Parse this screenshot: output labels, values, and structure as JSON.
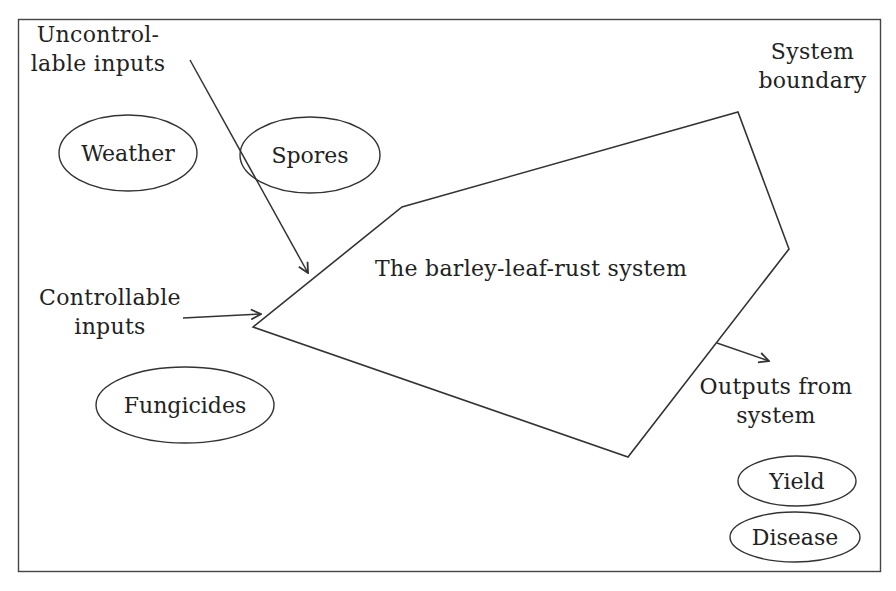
{
  "diagram": {
    "title": "The barley-leaf-rust system",
    "labels": {
      "uncontrollable_line1": "Uncontrol-",
      "uncontrollable_line2": "lable inputs",
      "controllable_line1": "Controllable",
      "controllable_line2": "inputs",
      "boundary_line1": "System",
      "boundary_line2": "boundary",
      "outputs_line1": "Outputs from",
      "outputs_line2": "system"
    },
    "ellipses": {
      "weather": "Weather",
      "spores": "Spores",
      "fungicides": "Fungicides",
      "yield": "Yield",
      "disease": "Disease"
    },
    "colors": {
      "stroke": "#333333",
      "text": "#222222",
      "background": "#ffffff"
    }
  }
}
